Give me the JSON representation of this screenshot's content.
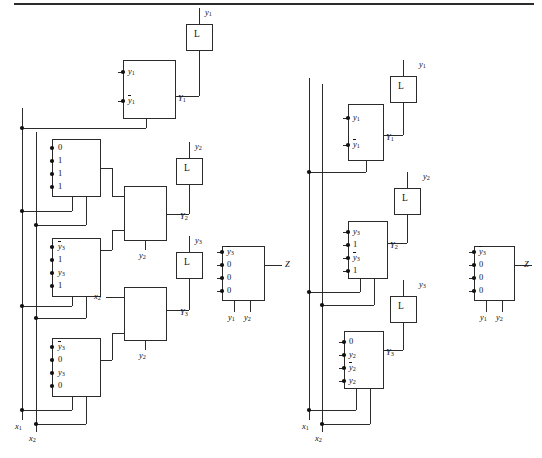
{
  "figure": {
    "line_color": "#2b2b2b",
    "dot_color": "#111111",
    "background": "#ffffff",
    "top_rule": true
  },
  "left_circuit": {
    "name": "left-network",
    "inputs": [
      {
        "name": "x1",
        "label": "x",
        "sub": "1"
      },
      {
        "name": "x2",
        "label": "x",
        "sub": "2"
      }
    ],
    "latches": [
      {
        "name": "latch-y1",
        "body": "L",
        "out_label": "y",
        "out_sub": "1",
        "in_label": "Y",
        "in_sub": "1"
      },
      {
        "name": "latch-y2",
        "body": "L",
        "out_label": "y",
        "out_sub": "2",
        "in_label": "Y",
        "in_sub": "2"
      },
      {
        "name": "latch-y3",
        "body": "L",
        "out_label": "y",
        "out_sub": "3",
        "in_label": "Y",
        "in_sub": "3"
      }
    ],
    "muxes": [
      {
        "name": "mux-left-Y1",
        "inputs": [
          {
            "text": "y",
            "sub": "1",
            "bar": false
          },
          {
            "text": "y",
            "sub": "1",
            "bar": true
          }
        ],
        "output": {
          "label": "Y",
          "sub": "1"
        },
        "selects": []
      },
      {
        "name": "mux-left-a",
        "inputs": [
          {
            "text": "0",
            "sub": "",
            "bar": false
          },
          {
            "text": "1",
            "sub": "",
            "bar": false
          },
          {
            "text": "1",
            "sub": "",
            "bar": false
          },
          {
            "text": "1",
            "sub": "",
            "bar": false
          }
        ],
        "output": {
          "label": "",
          "sub": ""
        },
        "selects": []
      },
      {
        "name": "mux-left-b",
        "inputs": [
          {
            "text": "y",
            "sub": "3",
            "bar": true
          },
          {
            "text": "1",
            "sub": "",
            "bar": false
          },
          {
            "text": "y",
            "sub": "3",
            "bar": false
          },
          {
            "text": "1",
            "sub": "",
            "bar": false
          }
        ],
        "output": {
          "label": "",
          "sub": ""
        },
        "selects": []
      },
      {
        "name": "mux-left-c",
        "inputs": [
          {
            "text": "y",
            "sub": "3",
            "bar": true
          },
          {
            "text": "0",
            "sub": "",
            "bar": false
          },
          {
            "text": "y",
            "sub": "3",
            "bar": false
          },
          {
            "text": "0",
            "sub": "",
            "bar": false
          }
        ],
        "output": {
          "label": "",
          "sub": ""
        },
        "selects": []
      },
      {
        "name": "mux-left-Y2",
        "inputs": [],
        "output": {
          "label": "Y",
          "sub": "2"
        },
        "selects": [
          {
            "label": "y",
            "sub": "2"
          }
        ]
      },
      {
        "name": "mux-left-Y3",
        "inputs": [
          {
            "text": "x",
            "sub": "2",
            "bar": false
          }
        ],
        "output": {
          "label": "Y",
          "sub": "3"
        },
        "selects": [
          {
            "label": "y",
            "sub": "2"
          }
        ]
      }
    ],
    "output_mux": {
      "name": "mux-left-Z",
      "inputs": [
        {
          "text": "y",
          "sub": "3",
          "bar": true
        },
        {
          "text": "0",
          "sub": "",
          "bar": false
        },
        {
          "text": "0",
          "sub": "",
          "bar": false
        },
        {
          "text": "0",
          "sub": "",
          "bar": false
        }
      ],
      "output": {
        "label": "Z",
        "sub": ""
      },
      "selects": [
        {
          "label": "y",
          "sub": "1"
        },
        {
          "label": "y",
          "sub": "2"
        }
      ]
    }
  },
  "right_circuit": {
    "name": "right-network",
    "inputs": [
      {
        "name": "x1",
        "label": "x",
        "sub": "1"
      },
      {
        "name": "x2",
        "label": "x",
        "sub": "2"
      }
    ],
    "latches": [
      {
        "name": "latch-y1",
        "body": "L",
        "out_label": "y",
        "out_sub": "1",
        "in_label": "Y",
        "in_sub": "1"
      },
      {
        "name": "latch-y2",
        "body": "L",
        "out_label": "y",
        "out_sub": "2",
        "in_label": "Y",
        "in_sub": "2"
      },
      {
        "name": "latch-y3",
        "body": "L",
        "out_label": "y",
        "out_sub": "3",
        "in_label": "Y",
        "in_sub": "3"
      }
    ],
    "muxes": [
      {
        "name": "mux-right-Y1",
        "inputs": [
          {
            "text": "y",
            "sub": "1",
            "bar": false
          },
          {
            "text": "y",
            "sub": "1",
            "bar": true
          }
        ],
        "output": {
          "label": "Y",
          "sub": "1"
        },
        "selects": []
      },
      {
        "name": "mux-right-Y2",
        "inputs": [
          {
            "text": "y",
            "sub": "3",
            "bar": false
          },
          {
            "text": "1",
            "sub": "",
            "bar": false
          },
          {
            "text": "y",
            "sub": "3",
            "bar": true
          },
          {
            "text": "1",
            "sub": "",
            "bar": false
          }
        ],
        "output": {
          "label": "Y",
          "sub": "2"
        },
        "selects": []
      },
      {
        "name": "mux-right-Y3",
        "inputs": [
          {
            "text": "0",
            "sub": "",
            "bar": false
          },
          {
            "text": "y",
            "sub": "2",
            "bar": false
          },
          {
            "text": "y",
            "sub": "2",
            "bar": true
          },
          {
            "text": "y",
            "sub": "2",
            "bar": false
          }
        ],
        "output": {
          "label": "Y",
          "sub": "3"
        },
        "selects": []
      }
    ],
    "output_mux": {
      "name": "mux-right-Z",
      "inputs": [
        {
          "text": "y",
          "sub": "3",
          "bar": true
        },
        {
          "text": "0",
          "sub": "",
          "bar": false
        },
        {
          "text": "0",
          "sub": "",
          "bar": false
        },
        {
          "text": "0",
          "sub": "",
          "bar": false
        }
      ],
      "output": {
        "label": "Z",
        "sub": ""
      },
      "selects": [
        {
          "label": "y",
          "sub": "1"
        },
        {
          "label": "y",
          "sub": "2"
        }
      ]
    }
  }
}
